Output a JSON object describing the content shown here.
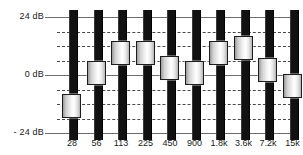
{
  "widget": {
    "title": "Graphic Equalizer",
    "type": "10-band-graphic-equalizer"
  },
  "axis": {
    "y_labels": [
      {
        "text": "24 dB",
        "db": 24
      },
      {
        "text": "0 dB",
        "db": 0
      },
      {
        "text": "- 24 dB",
        "db": -24
      }
    ],
    "y_unit": "dB",
    "y_min": -24,
    "y_max": 24,
    "gridline_step_db": 6,
    "solid_gridlines_db": [
      24,
      0,
      -24
    ],
    "dashed_gridlines_db": [
      18,
      12,
      6,
      -6,
      -12,
      -18
    ],
    "x_unit": "Hz"
  },
  "colors": {
    "background": "#ffffff",
    "track": "#111111",
    "gridline_solid": "#6e6e6e",
    "gridline_dashed": "#4a4a4a",
    "thumb_highlight": "#ffffff",
    "thumb_shadow": "#9a9a9a",
    "text": "#1a1a1a"
  },
  "chart_data": {
    "type": "bar",
    "xlabel": "",
    "ylabel": "dB",
    "ylim": [
      -24,
      24
    ],
    "grid": true,
    "legend": "none",
    "categories": [
      "28",
      "56",
      "113",
      "225",
      "450",
      "900",
      "1.8k",
      "3.6k",
      "7.2k",
      "15k"
    ],
    "values": [
      -13,
      1,
      9,
      9,
      3,
      1,
      9,
      11,
      2,
      -4.5
    ]
  },
  "bands": [
    {
      "freq": "28",
      "db": -13,
      "name": "band-28"
    },
    {
      "freq": "56",
      "db": 1,
      "name": "band-56"
    },
    {
      "freq": "113",
      "db": 9,
      "name": "band-113"
    },
    {
      "freq": "225",
      "db": 9,
      "name": "band-225"
    },
    {
      "freq": "450",
      "db": 3,
      "name": "band-450"
    },
    {
      "freq": "900",
      "db": 1,
      "name": "band-900"
    },
    {
      "freq": "1.8k",
      "db": 9,
      "name": "band-1800"
    },
    {
      "freq": "3.6k",
      "db": 11,
      "name": "band-3600"
    },
    {
      "freq": "7.2k",
      "db": 2,
      "name": "band-7200"
    },
    {
      "freq": "15k",
      "db": -4.5,
      "name": "band-15000"
    }
  ]
}
